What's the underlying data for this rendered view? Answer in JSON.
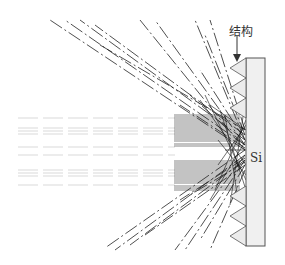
{
  "diagram": {
    "type": "ray-trace schematic",
    "labels": {
      "structure": "结构",
      "substrate": "Si"
    },
    "elements": {
      "substrate": {
        "name": "Si",
        "fill": "#f0f0f0",
        "stroke": "#555555"
      },
      "surface_structure": {
        "shape": "sawtooth / pyramids",
        "fill": "#e8e8e8",
        "stroke": "#555555"
      },
      "incident_rays": {
        "direction": "left-to-right",
        "bands": 2
      },
      "reflected_rays": {
        "directions": [
          "upper-left",
          "lower-left"
        ],
        "style": "dashed"
      }
    },
    "colors": {
      "ray": "#222222",
      "faint_ray": "#bbbbbb",
      "outline": "#555555"
    }
  }
}
